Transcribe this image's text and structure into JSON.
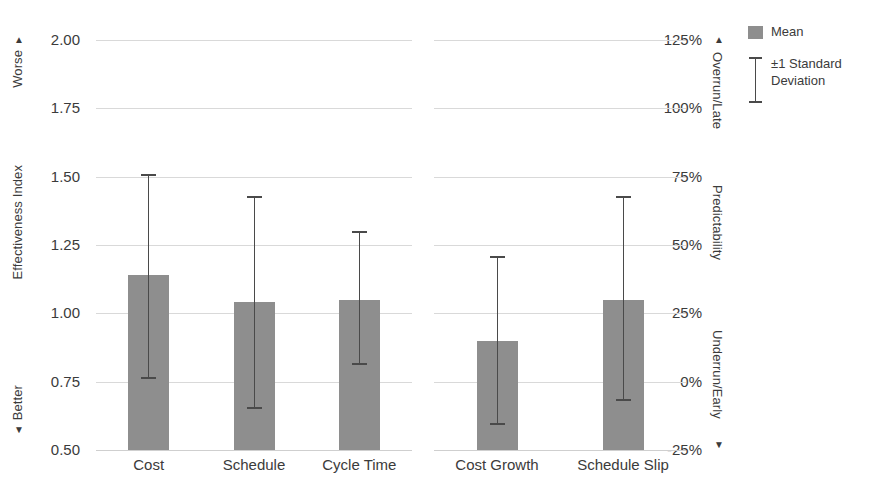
{
  "chart_data": {
    "type": "bar",
    "title": "",
    "subtitle": "",
    "grid": true,
    "legend_position": "right",
    "categories": [
      "Cost",
      "Schedule",
      "Cycle Time",
      "Cost Growth",
      "Schedule Slip"
    ],
    "series": [
      {
        "name": "Mean",
        "values": [
          1.14,
          1.04,
          1.05,
          0.9,
          1.05
        ]
      },
      {
        "name": "±1 Standard Deviation",
        "upper": [
          1.51,
          1.43,
          1.3,
          1.21,
          1.43
        ],
        "lower": [
          0.76,
          0.65,
          0.81,
          0.59,
          0.68
        ]
      }
    ],
    "panels": [
      {
        "name": "effectiveness",
        "categories": [
          "Cost",
          "Schedule",
          "Cycle Time"
        ],
        "means": [
          1.14,
          1.04,
          1.05
        ],
        "upper": [
          1.51,
          1.43,
          1.3
        ],
        "lower": [
          0.76,
          0.65,
          0.81
        ]
      },
      {
        "name": "predictability",
        "categories": [
          "Cost Growth",
          "Schedule Slip"
        ],
        "means": [
          0.9,
          1.05
        ],
        "upper": [
          1.21,
          1.43
        ],
        "lower": [
          0.59,
          0.68
        ]
      }
    ],
    "xlabel": "",
    "ylabel": "Effectiveness Index",
    "ylim": [
      0.5,
      2.0
    ],
    "yticks": [
      "2.00",
      "1.75",
      "1.50",
      "1.25",
      "1.00",
      "0.75",
      "0.50"
    ],
    "ytick_values": [
      2.0,
      1.75,
      1.5,
      1.25,
      1.0,
      0.75,
      0.5
    ],
    "y2label": "Predictability",
    "y2lim": [
      -25,
      125
    ],
    "y2ticks": [
      "125%",
      "100%",
      "75%",
      "50%",
      "25%",
      "0%",
      "-25%"
    ],
    "y2tick_values": [
      125,
      100,
      75,
      50,
      25,
      0,
      -25
    ],
    "bar_color": "#8e8e8e",
    "error_color": "#4a4a4a",
    "grid_color": "#d9d9d9"
  },
  "left_axis": {
    "title": "Effectiveness Index",
    "top_label": "Worse",
    "top_arrow": "▲",
    "bottom_label": "Better",
    "bottom_arrow": "▼",
    "ticks": [
      {
        "label": "2.00",
        "value": 2.0
      },
      {
        "label": "1.75",
        "value": 1.75
      },
      {
        "label": "1.50",
        "value": 1.5
      },
      {
        "label": "1.25",
        "value": 1.25
      },
      {
        "label": "1.00",
        "value": 1.0
      },
      {
        "label": "0.75",
        "value": 0.75
      },
      {
        "label": "0.50",
        "value": 0.5
      }
    ]
  },
  "right_axis": {
    "title": "Predictability",
    "top_label": "Overrun/Late",
    "top_arrow": "▲",
    "bottom_label": "Underrun/Early",
    "bottom_arrow": "▼",
    "ticks": [
      {
        "label": "125%",
        "value": 125
      },
      {
        "label": "100%",
        "value": 100
      },
      {
        "label": "75%",
        "value": 75
      },
      {
        "label": "50%",
        "value": 50
      },
      {
        "label": "25%",
        "value": 25
      },
      {
        "label": "0%",
        "value": 0
      },
      {
        "label": "-25%",
        "value": -25
      }
    ]
  },
  "legend": {
    "items": [
      {
        "label": "Mean",
        "type": "swatch",
        "color": "#8e8e8e"
      },
      {
        "label": "±1 Standard\nDeviation",
        "line1": "±1 Standard",
        "line2": "Deviation",
        "type": "errorbar",
        "color": "#4a4a4a"
      }
    ]
  }
}
